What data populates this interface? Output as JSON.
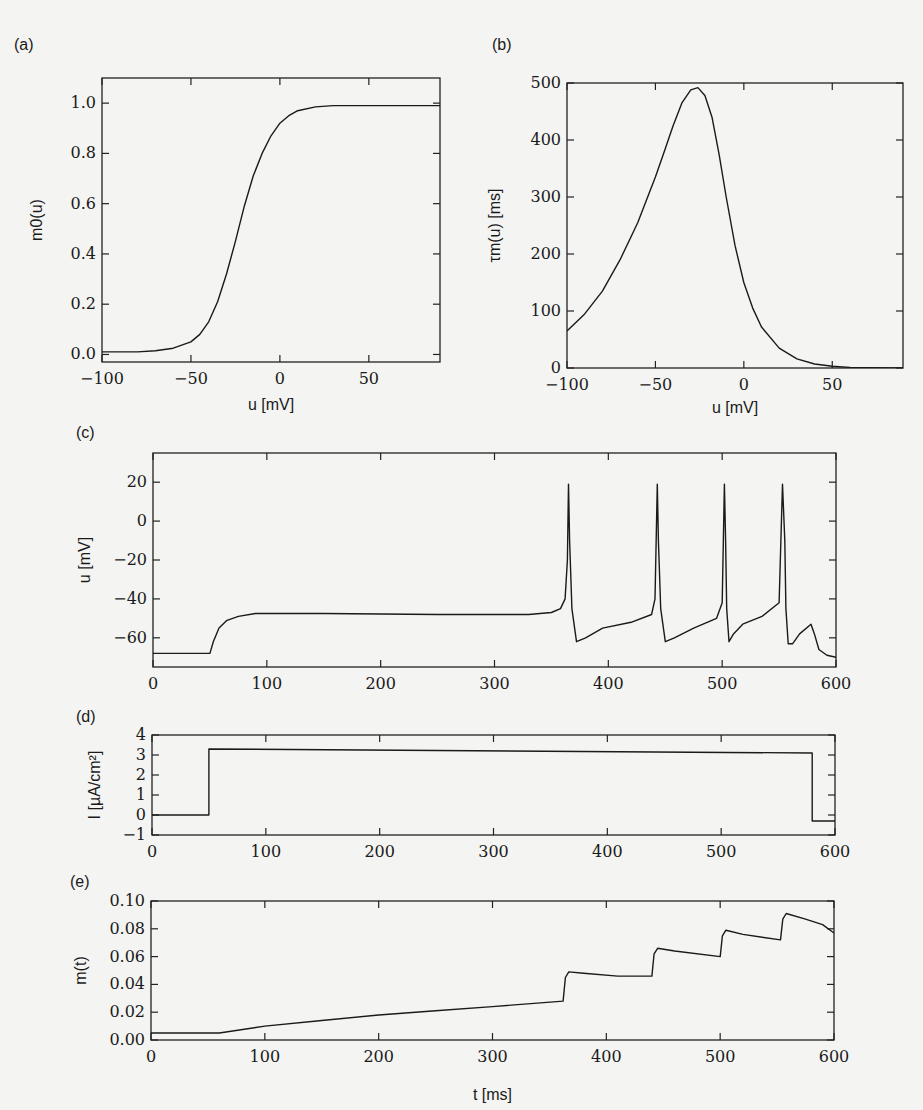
{
  "figure": {
    "panels": [
      "(a)",
      "(b)",
      "(c)",
      "(d)",
      "(e)"
    ]
  },
  "chart_data": [
    {
      "id": "a",
      "panel_label": "(a)",
      "type": "line",
      "title": "",
      "xlabel": "u [mV]",
      "ylabel": "m0(u)",
      "xlim": [
        -100,
        90
      ],
      "ylim": [
        -0.03,
        1.1
      ],
      "xticks": [
        -100,
        -50,
        0,
        50
      ],
      "yticks": [
        0.0,
        0.2,
        0.4,
        0.6,
        0.8,
        1.0
      ],
      "xtick_labels": [
        "−100",
        "−50",
        "0",
        "50"
      ],
      "ytick_labels": [
        "0.0",
        "0.2",
        "0.4",
        "0.6",
        "0.8",
        "1.0"
      ],
      "series": [
        {
          "name": "m0(u)",
          "x": [
            -100,
            -80,
            -70,
            -60,
            -50,
            -45,
            -40,
            -35,
            -30,
            -25,
            -20,
            -15,
            -10,
            -5,
            0,
            5,
            10,
            20,
            30,
            50,
            90
          ],
          "y": [
            0.01,
            0.01,
            0.015,
            0.025,
            0.05,
            0.08,
            0.13,
            0.21,
            0.32,
            0.45,
            0.59,
            0.71,
            0.8,
            0.87,
            0.92,
            0.95,
            0.97,
            0.985,
            0.99,
            0.99,
            0.99
          ]
        }
      ]
    },
    {
      "id": "b",
      "panel_label": "(b)",
      "type": "line",
      "title": "",
      "xlabel": "u [mV]",
      "ylabel": "τm(u) [ms]",
      "xlim": [
        -100,
        90
      ],
      "ylim": [
        0,
        500
      ],
      "xticks": [
        -100,
        -50,
        0,
        50
      ],
      "yticks": [
        0,
        100,
        200,
        300,
        400,
        500
      ],
      "xtick_labels": [
        "−100",
        "−50",
        "0",
        "50"
      ],
      "ytick_labels": [
        "0",
        "100",
        "200",
        "300",
        "400",
        "500"
      ],
      "series": [
        {
          "name": "tau_m(u)",
          "x": [
            -100,
            -90,
            -80,
            -70,
            -60,
            -50,
            -45,
            -40,
            -35,
            -30,
            -26,
            -22,
            -18,
            -14,
            -10,
            -5,
            0,
            5,
            10,
            20,
            30,
            40,
            50,
            60,
            70,
            90
          ],
          "y": [
            65,
            95,
            135,
            190,
            255,
            335,
            380,
            425,
            465,
            488,
            492,
            478,
            440,
            375,
            300,
            215,
            150,
            105,
            72,
            35,
            16,
            7,
            3,
            1,
            0.5,
            0
          ]
        }
      ]
    },
    {
      "id": "c",
      "panel_label": "(c)",
      "type": "line",
      "title": "",
      "xlabel": "",
      "ylabel": "u [mV]",
      "xlim": [
        0,
        600
      ],
      "ylim": [
        -75,
        35
      ],
      "xticks": [
        0,
        100,
        200,
        300,
        400,
        500,
        600
      ],
      "yticks": [
        -60,
        -40,
        -20,
        0,
        20
      ],
      "xtick_labels": [
        "0",
        "100",
        "200",
        "300",
        "400",
        "500",
        "600"
      ],
      "ytick_labels": [
        "−60",
        "−40",
        "−20",
        "0",
        "20"
      ],
      "series": [
        {
          "name": "membrane potential u(t)",
          "x": [
            0,
            49,
            50,
            53,
            58,
            65,
            75,
            90,
            150,
            250,
            330,
            350,
            358,
            362,
            364,
            365,
            366,
            368,
            372,
            380,
            395,
            420,
            438,
            441,
            443,
            444,
            446,
            450,
            458,
            475,
            495,
            500,
            502,
            503,
            504,
            506,
            510,
            518,
            535,
            550,
            553,
            555,
            556,
            558,
            562,
            568,
            578,
            581,
            585,
            592,
            600
          ],
          "y": [
            -68,
            -68,
            -68,
            -62,
            -55,
            -51,
            -49,
            -47.5,
            -47.5,
            -48,
            -48,
            -47,
            -45,
            -40,
            -20,
            19,
            -10,
            -45,
            -62,
            -60,
            -55,
            -52,
            -48,
            -40,
            19,
            -10,
            -45,
            -62,
            -60,
            -55,
            -50,
            -42,
            19,
            -10,
            -45,
            -62,
            -58,
            -53,
            -49,
            -42,
            19,
            -10,
            -45,
            -63,
            -63,
            -58,
            -53,
            -58,
            -66,
            -69,
            -70
          ]
        }
      ]
    },
    {
      "id": "d",
      "panel_label": "(d)",
      "type": "line",
      "title": "",
      "xlabel": "",
      "ylabel": "I [µA/cm²]",
      "xlim": [
        0,
        600
      ],
      "ylim": [
        -1,
        4
      ],
      "xticks": [
        0,
        100,
        200,
        300,
        400,
        500,
        600
      ],
      "yticks": [
        -1,
        0,
        1,
        2,
        3,
        4
      ],
      "xtick_labels": [
        "0",
        "100",
        "200",
        "300",
        "400",
        "500",
        "600"
      ],
      "ytick_labels": [
        "−1",
        "0",
        "1",
        "2",
        "3",
        "4"
      ],
      "series": [
        {
          "name": "input current I(t)",
          "x": [
            0,
            50,
            50,
            580,
            580,
            600
          ],
          "y": [
            0,
            0,
            3.3,
            3.1,
            -0.3,
            -0.3
          ]
        }
      ]
    },
    {
      "id": "e",
      "panel_label": "(e)",
      "type": "line",
      "title": "",
      "xlabel": "t [ms]",
      "ylabel": "m(t)",
      "xlim": [
        0,
        600
      ],
      "ylim": [
        0,
        0.1
      ],
      "xticks": [
        0,
        100,
        200,
        300,
        400,
        500,
        600
      ],
      "yticks": [
        0.0,
        0.02,
        0.04,
        0.06,
        0.08,
        0.1
      ],
      "xtick_labels": [
        "0",
        "100",
        "200",
        "300",
        "400",
        "500",
        "600"
      ],
      "ytick_labels": [
        "0.00",
        "0.02",
        "0.04",
        "0.06",
        "0.08",
        "0.10"
      ],
      "series": [
        {
          "name": "gating variable m(t)",
          "x": [
            0,
            60,
            100,
            150,
            200,
            250,
            300,
            362,
            364,
            367,
            380,
            410,
            440,
            442,
            445,
            460,
            500,
            502,
            505,
            520,
            553,
            555,
            558,
            575,
            590,
            600
          ],
          "y": [
            0.005,
            0.005,
            0.01,
            0.014,
            0.018,
            0.021,
            0.024,
            0.028,
            0.045,
            0.049,
            0.048,
            0.046,
            0.046,
            0.062,
            0.066,
            0.064,
            0.06,
            0.075,
            0.079,
            0.076,
            0.072,
            0.087,
            0.091,
            0.087,
            0.083,
            0.077
          ]
        }
      ]
    }
  ]
}
